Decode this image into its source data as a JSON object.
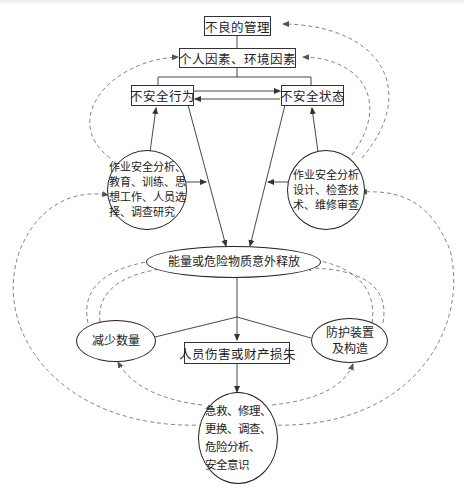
{
  "diagram": {
    "type": "accident-causation-control-flow",
    "colors": {
      "line": "#333333",
      "dashed": "#666666",
      "background": "#ffffff"
    },
    "nodes": {
      "poor_management": "不良的管理",
      "personal_env_factors": "个人因素、环境因素",
      "unsafe_act": "不安全行为",
      "unsafe_condition": "不安全状态",
      "act_controls": "作业安全分析、\n教育、训练、思\n想工作、人员选\n择、调查研究",
      "condition_controls": "作业安全分析\n设计、检查技\n术、维修审查",
      "energy_release": "能量或危险物质意外释放",
      "reduce_quantity": "减少数量",
      "protective_devices": "防护装置\n及构造",
      "injury_loss": "人员伤害或财产损失",
      "post_accident": "急救、修理、\n更换、调查、\n危险分析、\n安全意识"
    },
    "edges": [
      {
        "from": "poor_management",
        "to": "personal_env_factors",
        "style": "solid"
      },
      {
        "from": "personal_env_factors",
        "to": "unsafe_act",
        "style": "solid"
      },
      {
        "from": "personal_env_factors",
        "to": "unsafe_condition",
        "style": "solid"
      },
      {
        "from": "unsafe_act",
        "to": "unsafe_condition",
        "style": "solid-arrow"
      },
      {
        "from": "unsafe_condition",
        "to": "unsafe_act",
        "style": "solid-arrow"
      },
      {
        "from": "act_controls",
        "to": "unsafe_act",
        "style": "solid-arrow"
      },
      {
        "from": "condition_controls",
        "to": "unsafe_condition",
        "style": "solid-arrow"
      },
      {
        "from": "unsafe_act",
        "to": "energy_release",
        "style": "solid-arrow"
      },
      {
        "from": "unsafe_condition",
        "to": "energy_release",
        "style": "solid-arrow"
      },
      {
        "from": "energy_release",
        "to": "injury_loss",
        "style": "solid-arrow"
      },
      {
        "from": "injury_loss",
        "to": "post_accident",
        "style": "solid-arrow"
      },
      {
        "from": "act_controls",
        "to": "personal_env_factors",
        "style": "dashed-arrow"
      },
      {
        "from": "condition_controls",
        "to": "poor_management",
        "style": "dashed-arrow"
      },
      {
        "from": "condition_controls",
        "to": "personal_env_factors",
        "style": "dashed-arrow"
      },
      {
        "from": "reduce_quantity",
        "to": "energy_release",
        "style": "dashed-arrow"
      },
      {
        "from": "protective_devices",
        "to": "energy_release",
        "style": "dashed-arrow"
      },
      {
        "from": "post_accident",
        "to": "act_controls",
        "style": "dashed-arrow"
      },
      {
        "from": "post_accident",
        "to": "condition_controls",
        "style": "dashed-arrow"
      },
      {
        "from": "post_accident",
        "to": "reduce_quantity",
        "style": "dashed-arrow"
      },
      {
        "from": "post_accident",
        "to": "protective_devices",
        "style": "dashed-arrow"
      }
    ]
  }
}
